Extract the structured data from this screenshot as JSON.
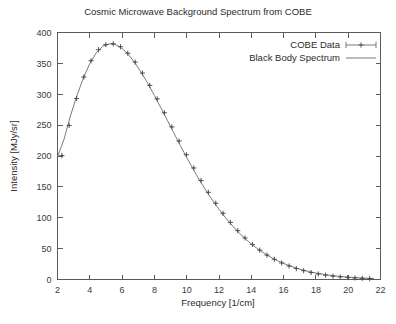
{
  "chart_data": {
    "type": "line",
    "title": "Cosmic Microwave Background Spectrum from COBE",
    "xlabel": "Frequency [1/cm]",
    "ylabel": "Intensity [MJy/sr]",
    "xlim": [
      2,
      22
    ],
    "ylim": [
      0,
      400
    ],
    "xticks": [
      2,
      4,
      6,
      8,
      10,
      12,
      14,
      16,
      18,
      20,
      22
    ],
    "yticks": [
      0,
      50,
      100,
      150,
      200,
      250,
      300,
      350,
      400
    ],
    "grid": false,
    "legend_position": "top-right",
    "legend": [
      {
        "name": "COBE Data",
        "style": "points-with-errorbars"
      },
      {
        "name": "Black Body Spectrum",
        "style": "line"
      }
    ],
    "series": [
      {
        "name": "COBE Data",
        "x": [
          2.27,
          2.72,
          3.18,
          3.63,
          4.08,
          4.54,
          4.99,
          5.45,
          5.9,
          6.35,
          6.81,
          7.26,
          7.71,
          8.17,
          8.62,
          9.08,
          9.53,
          9.98,
          10.44,
          10.89,
          11.34,
          11.8,
          12.25,
          12.71,
          13.16,
          13.61,
          14.07,
          14.52,
          14.97,
          15.43,
          15.88,
          16.34,
          16.79,
          17.24,
          17.7,
          18.15,
          18.6,
          19.06,
          19.51,
          19.97,
          20.42,
          20.87,
          21.33
        ],
        "y": [
          200.7,
          249.5,
          293.1,
          327.9,
          354.4,
          372.1,
          380.3,
          381.8,
          377.0,
          366.4,
          352.0,
          334.3,
          314.3,
          292.6,
          270.0,
          247.1,
          224.3,
          202.1,
          180.6,
          160.3,
          141.2,
          123.5,
          107.2,
          92.4,
          79.1,
          67.3,
          56.8,
          47.6,
          39.6,
          32.7,
          26.8,
          21.9,
          17.7,
          14.2,
          11.3,
          8.9,
          7.0,
          5.4,
          4.2,
          3.2,
          2.5,
          1.9,
          1.4
        ],
        "yerr": [
          1.6,
          1.6,
          1.6,
          1.6,
          1.6,
          1.6,
          1.6,
          1.6,
          1.6,
          1.6,
          1.6,
          1.6,
          1.6,
          1.6,
          1.6,
          1.6,
          1.6,
          1.6,
          1.6,
          1.6,
          1.6,
          1.6,
          1.6,
          1.6,
          1.6,
          1.6,
          1.6,
          1.6,
          1.6,
          1.6,
          1.6,
          1.6,
          1.6,
          1.6,
          1.6,
          1.6,
          1.6,
          1.6,
          1.6,
          1.6,
          1.6,
          1.6,
          1.6
        ]
      },
      {
        "name": "Black Body Spectrum",
        "x": [
          2.0,
          2.4,
          2.8,
          3.2,
          3.6,
          4.0,
          4.4,
          4.8,
          5.2,
          5.6,
          6.0,
          6.4,
          6.8,
          7.2,
          7.6,
          8.0,
          8.4,
          8.8,
          9.2,
          9.6,
          10.0,
          10.4,
          10.8,
          11.2,
          11.6,
          12.0,
          12.4,
          12.8,
          13.2,
          13.6,
          14.0,
          14.4,
          14.8,
          15.2,
          15.6,
          16.0,
          16.4,
          16.8,
          17.2,
          17.6,
          18.0,
          18.4,
          18.8,
          19.2,
          19.6,
          20.0,
          20.4,
          20.8,
          21.2,
          21.6
        ],
        "y": [
          198.3,
          226.8,
          265.0,
          297.5,
          326.2,
          349.8,
          367.2,
          377.8,
          381.8,
          380.4,
          374.2,
          364.1,
          350.6,
          334.8,
          317.2,
          298.0,
          278.2,
          258.0,
          237.6,
          217.2,
          197.6,
          178.7,
          160.7,
          143.9,
          128.2,
          113.6,
          100.2,
          87.9,
          76.7,
          66.7,
          57.6,
          49.6,
          42.5,
          36.2,
          30.7,
          26.0,
          21.9,
          18.3,
          15.3,
          12.7,
          10.5,
          8.7,
          7.1,
          5.8,
          4.8,
          3.9,
          3.1,
          2.5,
          2.0,
          1.6
        ]
      }
    ]
  },
  "colors": {
    "axis": "#5a5a5a",
    "line": "#6b6b6b",
    "marker": "#4a4a4a",
    "text": "#2b2b2b",
    "background": "#ffffff"
  }
}
